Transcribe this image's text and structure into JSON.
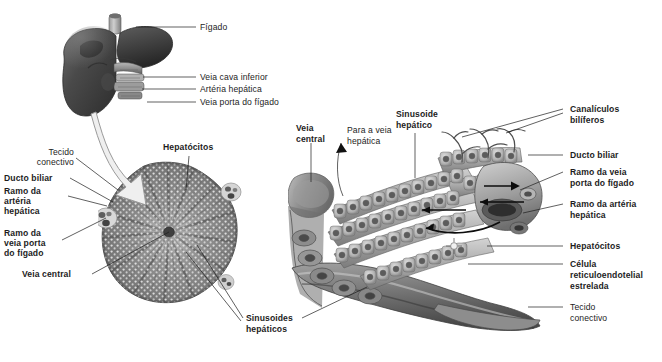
{
  "figure": {
    "language": "pt-BR",
    "style": "grayscale anatomical illustration",
    "background_color": "#ffffff",
    "text_color": "#1d1d1d"
  },
  "panels": {
    "organ": {
      "name": "figado-organ-panel"
    },
    "lobule_section": {
      "name": "lobulo-secao-transversal-panel"
    },
    "lobule_3d": {
      "name": "lobulo-3d-panel"
    }
  },
  "labels": {
    "figado": "Fígado",
    "veia_cava_inferior": "Veia cava inferior",
    "arteria_hepatica": "Artéria hepática",
    "veia_porta_do_figado": "Veia porta do fígado",
    "tecido_conectivo_l1": "Tecido",
    "tecido_conectivo_l2": "conectivo",
    "ducto_biliar_left": "Ducto biliar",
    "ramo_arteria_l1": "Ramo da",
    "ramo_arteria_l2": "artéria",
    "ramo_arteria_l3": "hepática",
    "ramo_veia_porta_l1": "Ramo da",
    "ramo_veia_porta_l2": "veia porta",
    "ramo_veia_porta_l3": "do fígado",
    "veia_central_left": "Veia central",
    "hepatocitos_left": "Hepatócitos",
    "sinusoides_hepaticos_l1": "Sinusoides",
    "sinusoides_hepaticos_l2": "hepáticos",
    "veia_central_right_l1": "Veia",
    "veia_central_right_l2": "central",
    "para_veia_hepatica_l1": "Para a veia",
    "para_veia_hepatica_l2": "hepática",
    "sinusoide_hepatico_l1": "Sinusoide",
    "sinusoide_hepatico_l2": "hepático",
    "canaliculos_biliferos_l1": "Canalículos",
    "canaliculos_biliferos_l2": "bilíferos",
    "ducto_biliar_right": "Ducto biliar",
    "ramo_veia_porta_r_l1": "Ramo da veia",
    "ramo_veia_porta_r_l2": "porta do fígado",
    "ramo_arteria_r_l1": "Ramo da artéria",
    "ramo_arteria_r_l2": "hepática",
    "hepatocitos_right": "Hepatócitos",
    "celula_reticulo_l1": "Célula",
    "celula_reticulo_l2": "reticuloendotelial",
    "celula_reticulo_l3": "estrelada",
    "tecido_conectivo_r_l1": "Tecido",
    "tecido_conectivo_r_l2": "conectivo"
  },
  "colors": {
    "ink": "#1d1d1d",
    "tissue_dark": "#4c4c4c",
    "tissue_mid": "#8e8e8e",
    "tissue_light": "#c9c9c9",
    "paper": "#ffffff"
  }
}
